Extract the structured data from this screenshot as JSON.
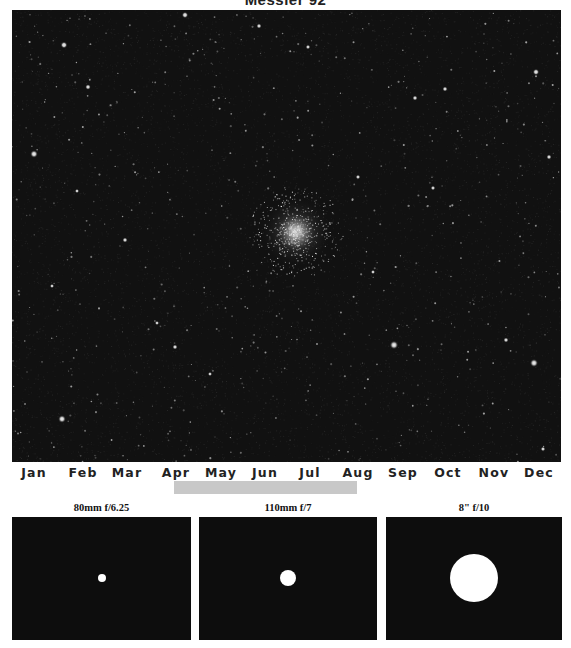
{
  "title": "Messier 92",
  "sky": {
    "background": "#111111",
    "cluster": {
      "cx": 284,
      "cy": 222,
      "core_radius": 9,
      "halo_radius": 36
    },
    "bright_stars": [
      {
        "x": 52,
        "y": 35,
        "r": 1.6
      },
      {
        "x": 173,
        "y": 5,
        "r": 1.5
      },
      {
        "x": 22,
        "y": 144,
        "r": 1.8
      },
      {
        "x": 76,
        "y": 77,
        "r": 1.3
      },
      {
        "x": 247,
        "y": 16,
        "r": 1.2
      },
      {
        "x": 403,
        "y": 88,
        "r": 1.2
      },
      {
        "x": 382,
        "y": 335,
        "r": 2.0
      },
      {
        "x": 522,
        "y": 353,
        "r": 1.9
      },
      {
        "x": 113,
        "y": 230,
        "r": 1.2
      },
      {
        "x": 50,
        "y": 409,
        "r": 1.8
      },
      {
        "x": 296,
        "y": 37,
        "r": 1.1
      },
      {
        "x": 433,
        "y": 79,
        "r": 1.2
      },
      {
        "x": 524,
        "y": 62,
        "r": 1.5
      },
      {
        "x": 537,
        "y": 147,
        "r": 1.2
      },
      {
        "x": 346,
        "y": 167,
        "r": 1.1
      },
      {
        "x": 163,
        "y": 337,
        "r": 1.2
      },
      {
        "x": 198,
        "y": 364,
        "r": 1.0
      },
      {
        "x": 361,
        "y": 262,
        "r": 1.0
      },
      {
        "x": 494,
        "y": 330,
        "r": 1.2
      },
      {
        "x": 421,
        "y": 178,
        "r": 1.1
      },
      {
        "x": 65,
        "y": 181,
        "r": 1.0
      },
      {
        "x": 145,
        "y": 313,
        "r": 1.0
      },
      {
        "x": 531,
        "y": 439,
        "r": 1.1
      },
      {
        "x": 40,
        "y": 276,
        "r": 1.0
      }
    ]
  },
  "calendar": {
    "months": [
      "Jan",
      "Feb",
      "Mar",
      "Apr",
      "May",
      "Jun",
      "Jul",
      "Aug",
      "Sep",
      "Oct",
      "Nov",
      "Dec"
    ],
    "month_centers": [
      34,
      83,
      127,
      176,
      221,
      265,
      310,
      358,
      403,
      448,
      494,
      539
    ],
    "visibility_bar": {
      "start_x": 174,
      "end_x": 357,
      "color": "#c8c8c8",
      "label_start": "Apr",
      "label_end": "Aug"
    }
  },
  "panels": [
    {
      "label": "80mm f/6.25",
      "x": 12,
      "width": 179,
      "disc_radius": 4
    },
    {
      "label": "110mm f/7",
      "x": 199,
      "width": 178,
      "disc_radius": 8
    },
    {
      "label": "8\" f/10",
      "x": 386,
      "width": 176,
      "disc_radius": 24
    }
  ]
}
